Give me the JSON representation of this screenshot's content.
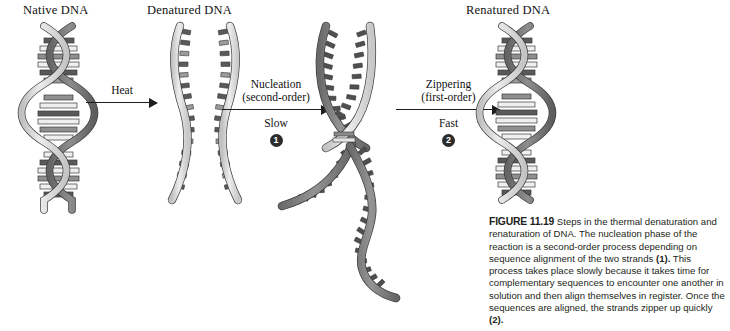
{
  "figure": {
    "number": "FIGURE 11.19",
    "caption_text": " Steps in the thermal denaturation and renaturation of DNA. The nucleation phase of the reaction is a second-order process depending on sequence alignment of the two strands ",
    "caption_ref_1": "(1).",
    "caption_text_2": " This process takes place slowly because it takes time for complementary sequences to encounter one another in solution and then align themselves in register. Once the sequences are aligned, the strands zipper up quickly ",
    "caption_ref_2": "(2)."
  },
  "states": {
    "native": "Native DNA",
    "denatured": "Denatured DNA",
    "renatured": "Renatured DNA"
  },
  "arrows": [
    {
      "id": "heat",
      "top_line_1": "Heat",
      "top_line_2": "",
      "sub_label": "",
      "badge": ""
    },
    {
      "id": "nucleation",
      "top_line_1": "Nucleation",
      "top_line_2": "(second-order)",
      "sub_label": "Slow",
      "badge": "1"
    },
    {
      "id": "zippering",
      "top_line_1": "Zippering",
      "top_line_2": "(first-order)",
      "sub_label": "Fast",
      "badge": "2"
    }
  ],
  "colors": {
    "background": "#ffffff",
    "text": "#1a1a1a",
    "caption_text": "#231f20",
    "strand_light": "#d9d9d9",
    "strand_dark": "#7a7a7a",
    "base_dark": "#4d4d4d",
    "base_mid": "#9a9a9a",
    "base_light": "#f2f2f2",
    "outline": "#3a3a3a",
    "badge_fill": "#2b2b2b"
  }
}
